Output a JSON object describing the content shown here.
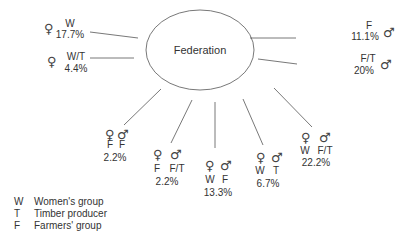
{
  "diagram": {
    "center_label": "Federation",
    "nodes": [
      {
        "id": "w",
        "female": "W",
        "male": "",
        "pct": "17.7%"
      },
      {
        "id": "wt",
        "female": "W/T",
        "male": "",
        "pct": "4.4%"
      },
      {
        "id": "f",
        "female": "",
        "male": "F",
        "pct": "11.1%"
      },
      {
        "id": "ft",
        "female": "",
        "male": "F/T",
        "pct": "20%"
      },
      {
        "id": "f_f",
        "female": "F",
        "male": "F",
        "pct": "2.2%"
      },
      {
        "id": "f_ft",
        "female": "F",
        "male": "F/T",
        "pct": "2.2%"
      },
      {
        "id": "w_f",
        "female": "W",
        "male": "F",
        "pct": "13.3%"
      },
      {
        "id": "w_t",
        "female": "W",
        "male": "T",
        "pct": "6.7%"
      },
      {
        "id": "w_ft",
        "female": "W",
        "male": "F/T",
        "pct": "22.2%"
      }
    ],
    "symbols": {
      "female": "♀",
      "male": "♂"
    }
  },
  "legend": [
    {
      "key": "W",
      "label": "Women's group"
    },
    {
      "key": "T",
      "label": "Timber producer"
    },
    {
      "key": "F",
      "label": "Farmers' group"
    }
  ]
}
